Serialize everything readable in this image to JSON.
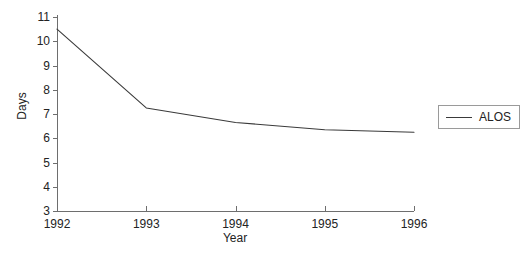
{
  "chart_data": {
    "type": "line",
    "title": "",
    "xlabel": "Year",
    "ylabel": "Days",
    "categories": [
      "1992",
      "1993",
      "1994",
      "1995",
      "1996"
    ],
    "x": [
      1992,
      1993,
      1994,
      1995,
      1996
    ],
    "series": [
      {
        "name": "ALOS",
        "values": [
          10.5,
          7.25,
          6.65,
          6.35,
          6.25
        ],
        "color": "#3a3a3a"
      }
    ],
    "ylim": [
      3,
      11
    ],
    "xlim": [
      1992,
      1996
    ],
    "yticks": [
      3,
      4,
      5,
      6,
      7,
      8,
      9,
      10,
      11
    ],
    "ytick_labels": [
      "3",
      "4",
      "5",
      "6",
      "7",
      "8",
      "9",
      "10",
      "11"
    ],
    "xticks": [
      1992,
      1993,
      1994,
      1995,
      1996
    ],
    "xtick_labels": [
      "1992",
      "1993",
      "1994",
      "1995",
      "1996"
    ],
    "grid": false,
    "legend_position": "right",
    "legend_entries": [
      "ALOS"
    ]
  },
  "axes": {
    "y_title": "Days",
    "x_title": "Year"
  },
  "legend": {
    "items": [
      {
        "label": "ALOS",
        "swatch": "line-swatch"
      }
    ]
  },
  "colors": {
    "line": "#3a3a3a",
    "axis": "#6e6e6e",
    "legend_border": "#9a9a9a",
    "text": "#232323",
    "background": "#ffffff"
  }
}
